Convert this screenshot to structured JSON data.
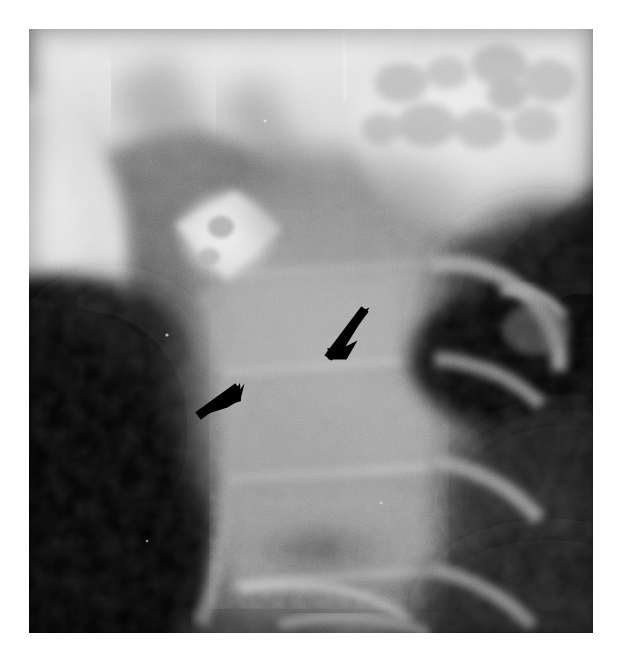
{
  "image": {
    "kind": "radiograph",
    "modality": "plain-film-xray",
    "view": "lateral-cervical-spine",
    "background_color": "#ffffff",
    "plate": {
      "left": 29,
      "top": 29,
      "width": 564,
      "height": 604,
      "base_tone": "#6a6a6a",
      "darkest": "#050505",
      "brightest": "#f2f2f2"
    },
    "tone_scale": {
      "air_black": "#060606",
      "soft_tissue_dark": "#2b2b2b",
      "soft_tissue_mid": "#5c5c5c",
      "bone_mid": "#8d8d8d",
      "bone_bright": "#c9c9c9",
      "bone_dense": "#eeeeee"
    },
    "regions": [
      {
        "name": "skull-base-and-mandible-bright-band",
        "label": "Dense bright band across the top of the film",
        "tone": "#e9e9e9",
        "position": "top"
      },
      {
        "name": "mottled-trabecular-patch",
        "label": "Mottled trabecular bone patch, upper right",
        "tone": "#dcdcdc",
        "position": "top-right"
      },
      {
        "name": "mandible-ramus-crescent",
        "label": "Bright crescent of the mandibular ramus, upper left",
        "tone": "#e4e4e4",
        "position": "top-left"
      },
      {
        "name": "airway-column-dark",
        "label": "Dark prevertebral air / soft-tissue column",
        "tone": "#0b0b0b",
        "position": "left-center"
      },
      {
        "name": "dens-anterior-arch-bright-focus",
        "label": "Bright rhomboid focus (dens / C1 anterior arch)",
        "tone": "#e0e0e0",
        "position": "upper-center-left"
      },
      {
        "name": "vertebral-body-column",
        "label": "Stacked cervical vertebral bodies, mid grey",
        "tone": "#9b9b9b",
        "position": "center"
      },
      {
        "name": "posterior-elements-dark-field",
        "label": "Dark field over posterior elements and spinous processes",
        "tone": "#101010",
        "position": "right-center"
      },
      {
        "name": "lower-vertebrae-endplates",
        "label": "Lower cervical endplates and disc spaces",
        "tone": "#8a8a8a",
        "position": "bottom-center"
      },
      {
        "name": "scratch-artifact-line",
        "label": "Thin bright vertical scratch artifact near top",
        "tone": "#f4f4f4",
        "position": "top-center"
      }
    ],
    "annotations": {
      "color": "#000000",
      "arrows": [
        {
          "name": "upper-arrow",
          "points_toward": "down-left",
          "description": "Solid black arrow in the mid-field pointing down and to the left",
          "tail": {
            "x": 363,
            "y": 311
          },
          "head": {
            "x": 328,
            "y": 359
          }
        },
        {
          "name": "lower-arrow",
          "points_toward": "up-right",
          "description": "Solid black arrow in the lower left field pointing up and to the right",
          "tail": {
            "x": 156,
            "y": 450
          },
          "head": {
            "x": 198,
            "y": 416
          }
        }
      ]
    }
  }
}
